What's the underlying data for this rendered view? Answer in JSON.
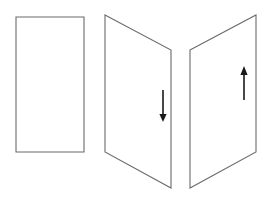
{
  "figure": {
    "background_color": "#ffffff",
    "width": 267,
    "height": 198,
    "outline_color": "#6b6b6b",
    "arrow_color": "#1a1a1a",
    "outline_width": 1.1
  },
  "shapes": [
    {
      "name": "flat-rectangle-panel",
      "type": "rectangle",
      "label": "",
      "points": "16,17 84,17 84,152 16,152",
      "has_arrow": false
    },
    {
      "name": "left-folded-panel",
      "type": "parallelogram",
      "label": "",
      "points": "105,15 171,50 171,188 105,152",
      "has_arrow": true,
      "arrow_direction": "down"
    },
    {
      "name": "right-folded-panel",
      "type": "parallelogram",
      "label": "",
      "points": "190,50 256,15 256,152 190,188",
      "has_arrow": true,
      "arrow_direction": "up"
    }
  ],
  "arrows": [
    {
      "name": "down-arrow",
      "direction": "down",
      "shaft_x": 163,
      "shaft_y_start": 90,
      "shaft_y_end": 117,
      "head_points": "159.4,114 166.6,114 163,122",
      "color": "#1a1a1a"
    },
    {
      "name": "up-arrow",
      "direction": "up",
      "shaft_x": 244,
      "shaft_y_start": 100,
      "shaft_y_end": 73,
      "head_points": "240.4,75 247.6,75 244,66",
      "color": "#1a1a1a"
    }
  ]
}
